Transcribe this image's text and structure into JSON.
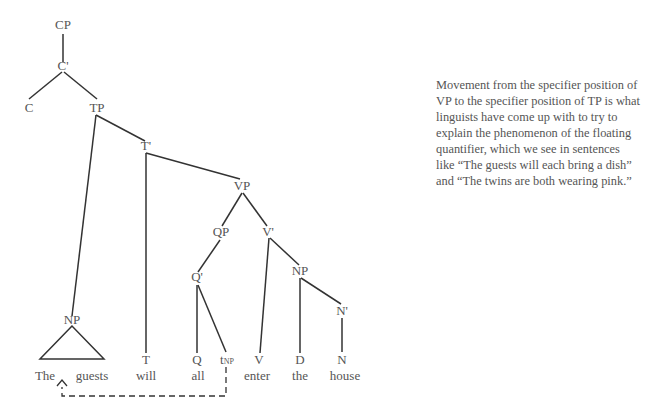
{
  "tree": {
    "nodes": {
      "cp": "CP",
      "c_bar": "C'",
      "c": "C",
      "tp": "TP",
      "t_bar": "T'",
      "np_subject": "NP",
      "t": "T",
      "vp": "VP",
      "qp": "QP",
      "v_bar": "V'",
      "q_bar": "Q'",
      "q": "Q",
      "trace": "t",
      "trace_sub": "NP",
      "v": "V",
      "np_object": "NP",
      "d": "D",
      "n_bar": "N'",
      "n": "N"
    },
    "words": {
      "the_subject": "The",
      "guests": "guests",
      "will": "will",
      "all": "all",
      "enter": "enter",
      "the_object": "the",
      "house": "house"
    },
    "movement": {
      "from": "tNP",
      "to": "NP (The guests)",
      "style": "dashed arrow"
    }
  },
  "caption": {
    "text": "Movement from the specifier position of VP to the specifier position of TP is what linguists have come up with to try to explain the phenomenon of the floating quantifier, which we see in sentences like “The guests will each bring a dish” and “The twins are both wearing pink.”"
  },
  "colors": {
    "text": "#555555",
    "lines": "#333333",
    "background": "#ffffff"
  }
}
